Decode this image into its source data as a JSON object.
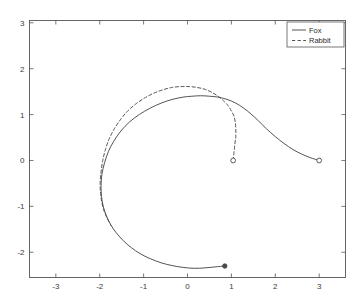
{
  "figure": {
    "background_color": "#ffffff",
    "axes_color": "#555555",
    "series_color": "#4a4a4a"
  },
  "chart_data": {
    "type": "line",
    "title": "",
    "xlabel": "",
    "ylabel": "",
    "xlim": [
      -3.6,
      3.6
    ],
    "ylim": [
      -2.55,
      3.05
    ],
    "grid": false,
    "xticks": [
      -3,
      -2,
      -1,
      0,
      1,
      2,
      3
    ],
    "xticklabels": [
      "-3",
      "-2",
      "-1",
      "0",
      "1",
      "2",
      "3"
    ],
    "yticks": [
      -2,
      -1,
      0,
      1,
      2,
      3
    ],
    "yticklabels": [
      "-2",
      "-1",
      "0",
      "1",
      "2",
      "3"
    ],
    "legend": {
      "position": "upper right",
      "entries": [
        {
          "label": "Fox",
          "style": "solid"
        },
        {
          "label": "Rabbit",
          "style": "dashed"
        }
      ]
    },
    "series": [
      {
        "name": "Fox",
        "style": "solid",
        "start_marker": {
          "type": "open-circle",
          "x": 3.0,
          "y": 0.0
        },
        "end_marker": {
          "type": "filled-circle",
          "x": 0.85,
          "y": -2.3
        },
        "points": [
          [
            3.0,
            0.0
          ],
          [
            2.8,
            0.06
          ],
          [
            2.6,
            0.14
          ],
          [
            2.4,
            0.24
          ],
          [
            2.2,
            0.37
          ],
          [
            2.0,
            0.52
          ],
          [
            1.8,
            0.69
          ],
          [
            1.62,
            0.86
          ],
          [
            1.45,
            1.01
          ],
          [
            1.28,
            1.14
          ],
          [
            1.1,
            1.25
          ],
          [
            0.9,
            1.33
          ],
          [
            0.7,
            1.38
          ],
          [
            0.5,
            1.4
          ],
          [
            0.3,
            1.41
          ],
          [
            0.1,
            1.4
          ],
          [
            -0.1,
            1.38
          ],
          [
            -0.35,
            1.33
          ],
          [
            -0.6,
            1.25
          ],
          [
            -0.85,
            1.14
          ],
          [
            -1.1,
            1.0
          ],
          [
            -1.32,
            0.84
          ],
          [
            -1.52,
            0.64
          ],
          [
            -1.68,
            0.42
          ],
          [
            -1.8,
            0.2
          ],
          [
            -1.89,
            -0.05
          ],
          [
            -1.95,
            -0.3
          ],
          [
            -1.97,
            -0.55
          ],
          [
            -1.96,
            -0.78
          ],
          [
            -1.92,
            -1.0
          ],
          [
            -1.85,
            -1.2
          ],
          [
            -1.75,
            -1.4
          ],
          [
            -1.62,
            -1.58
          ],
          [
            -1.46,
            -1.75
          ],
          [
            -1.28,
            -1.9
          ],
          [
            -1.08,
            -2.03
          ],
          [
            -0.85,
            -2.14
          ],
          [
            -0.6,
            -2.23
          ],
          [
            -0.35,
            -2.29
          ],
          [
            -0.1,
            -2.33
          ],
          [
            0.15,
            -2.35
          ],
          [
            0.4,
            -2.34
          ],
          [
            0.62,
            -2.32
          ],
          [
            0.85,
            -2.3
          ]
        ]
      },
      {
        "name": "Rabbit",
        "style": "dashed",
        "start_marker": {
          "type": "open-circle",
          "x": 1.04,
          "y": 0.0
        },
        "points": [
          [
            1.04,
            0.0
          ],
          [
            1.06,
            0.18
          ],
          [
            1.08,
            0.36
          ],
          [
            1.1,
            0.52
          ],
          [
            1.1,
            0.68
          ],
          [
            1.09,
            0.82
          ],
          [
            1.06,
            0.96
          ],
          [
            1.0,
            1.08
          ],
          [
            0.92,
            1.2
          ],
          [
            0.82,
            1.3
          ],
          [
            0.7,
            1.4
          ],
          [
            0.56,
            1.48
          ],
          [
            0.4,
            1.55
          ],
          [
            0.22,
            1.59
          ],
          [
            0.04,
            1.61
          ],
          [
            -0.16,
            1.61
          ],
          [
            -0.36,
            1.59
          ],
          [
            -0.56,
            1.54
          ],
          [
            -0.78,
            1.46
          ],
          [
            -0.98,
            1.36
          ],
          [
            -1.18,
            1.23
          ],
          [
            -1.36,
            1.08
          ],
          [
            -1.52,
            0.9
          ],
          [
            -1.66,
            0.7
          ],
          [
            -1.78,
            0.48
          ],
          [
            -1.87,
            0.24
          ],
          [
            -1.93,
            0.0
          ],
          [
            -1.97,
            -0.25
          ],
          [
            -1.99,
            -0.5
          ],
          [
            -1.98,
            -0.72
          ],
          [
            -1.95,
            -0.92
          ],
          [
            -1.9,
            -1.1
          ],
          [
            -1.83,
            -1.26
          ],
          [
            -1.74,
            -1.42
          ]
        ]
      }
    ]
  }
}
